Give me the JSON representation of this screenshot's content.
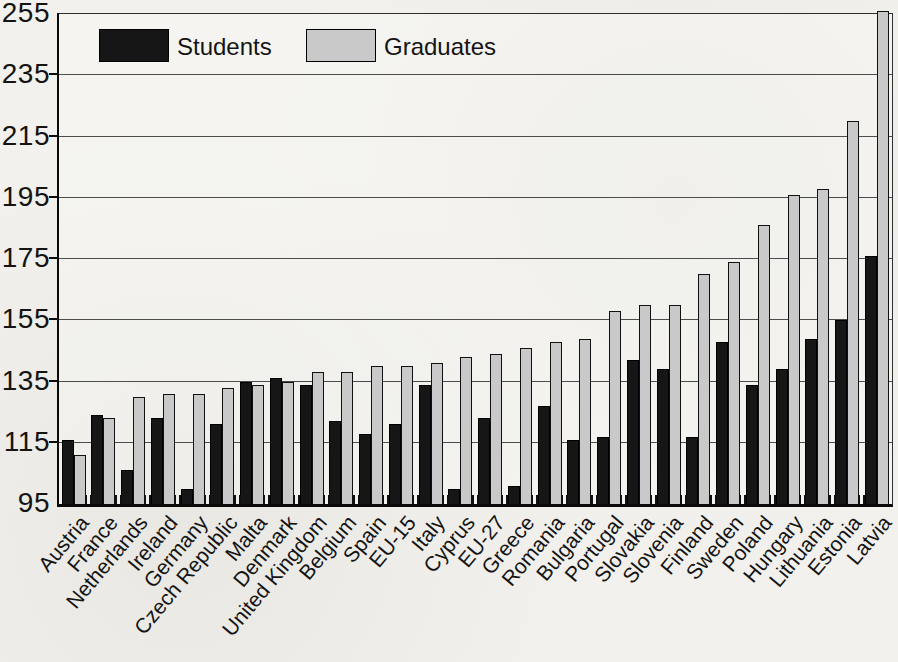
{
  "figure": {
    "background_color": "#f2f1ed",
    "plot_border_color": "#0a0a0a"
  },
  "legend": {
    "students_label": "Students",
    "graduates_label": "Graduates"
  },
  "chart_data": {
    "type": "bar",
    "title": "",
    "xlabel": "",
    "ylabel": "",
    "categories": [
      "Austria",
      "France",
      "Netherlands",
      "Ireland",
      "Germany",
      "Czech Republic",
      "Malta",
      "Denmark",
      "United Kingdom",
      "Belgium",
      "Spain",
      "EU-15",
      "Italy",
      "Cyprus",
      "EU-27",
      "Greece",
      "Romania",
      "Bulgaria",
      "Portugal",
      "Slovakia",
      "Slovenia",
      "Finland",
      "Sweden",
      "Poland",
      "Hungary",
      "Lithuania",
      "Estonia",
      "Latvia"
    ],
    "series": [
      {
        "name": "Students",
        "color": "#161616",
        "values": [
          116,
          124,
          106,
          123,
          100,
          121,
          135,
          136,
          134,
          122,
          118,
          121,
          134,
          100,
          123,
          101,
          127,
          116,
          117,
          142,
          139,
          117,
          148,
          134,
          139,
          149,
          155,
          176
        ]
      },
      {
        "name": "Graduates",
        "color": "#c9c9c9",
        "values": [
          111,
          123,
          130,
          131,
          131,
          133,
          134,
          135,
          138,
          138,
          140,
          140,
          141,
          143,
          144,
          146,
          148,
          149,
          158,
          160,
          160,
          170,
          174,
          186,
          196,
          198,
          220,
          256
        ]
      }
    ],
    "ylim": [
      95,
      255
    ],
    "yticks": [
      95,
      115,
      135,
      155,
      175,
      195,
      215,
      235,
      255
    ],
    "grid": "horizontal",
    "legend_position": "top-left-inside"
  }
}
